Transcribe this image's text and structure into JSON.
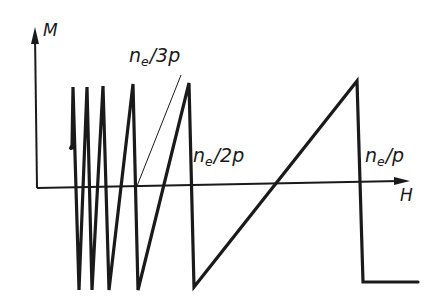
{
  "diagram": {
    "title": "",
    "axes": {
      "y_label": "M",
      "x_label": "H"
    },
    "annotations": [
      {
        "id": "ne_3p",
        "base": "n",
        "sub": "e",
        "suffix": "/3p",
        "text": "ne/3p"
      },
      {
        "id": "ne_2p",
        "base": "n",
        "sub": "e",
        "suffix": "/2p",
        "text": "ne/2p"
      },
      {
        "id": "ne_p",
        "base": "n",
        "sub": "e",
        "suffix": "/p",
        "text": "ne/p"
      }
    ],
    "colors": {
      "line": "#1a1a1a",
      "background": "#ffffff"
    },
    "curve_description": "Sawtooth magnetization M vs field H: rapid oscillations at low H with increasing period, jumps at ne/3p, ne/2p and ne/p, then flat negative value beyond ne/p"
  }
}
